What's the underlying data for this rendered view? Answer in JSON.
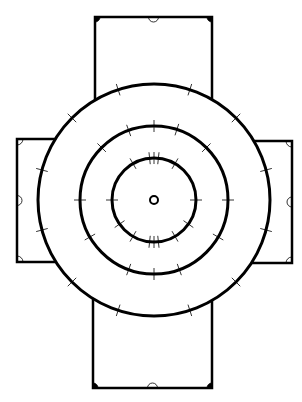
{
  "diagram": {
    "type": "plan-drawing",
    "colors": {
      "stroke": "#000000",
      "background": "#ffffff"
    },
    "center": {
      "x": 154,
      "y": 200
    },
    "rings": [
      {
        "name": "outer-ring",
        "r": 116,
        "ticks_deg": [
          -108,
          -72,
          -45,
          -15,
          15,
          45,
          72,
          108,
          135,
          165,
          195,
          225
        ]
      },
      {
        "name": "middle-ring",
        "r": 74,
        "ticks_deg": [
          -90,
          -72,
          -110,
          -45,
          -135,
          0,
          180,
          30,
          150,
          90,
          70,
          110
        ]
      },
      {
        "name": "inner-ring",
        "r": 42,
        "ticks_deg": [
          -90,
          -84,
          -96,
          -60,
          -120,
          0,
          180,
          35,
          145,
          90,
          84,
          96,
          60,
          120
        ]
      }
    ],
    "center_dot": {
      "r": 4
    },
    "bays": [
      {
        "name": "top-bay",
        "x1": 95,
        "y1": 17,
        "x2": 212,
        "y2": 100,
        "open_side": "bottom"
      },
      {
        "name": "bottom-bay",
        "x1": 93,
        "y1": 300,
        "x2": 212,
        "y2": 388,
        "open_side": "top"
      },
      {
        "name": "left-bay",
        "x1": 17,
        "y1": 139,
        "x2": 48,
        "y2": 262,
        "open_side": "right"
      },
      {
        "name": "right-bay",
        "x1": 258,
        "y1": 141,
        "x2": 292,
        "y2": 263,
        "open_side": "left"
      }
    ]
  },
  "caption": ""
}
